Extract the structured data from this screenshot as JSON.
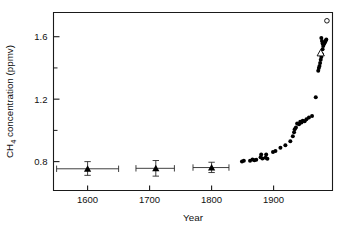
{
  "chart_data": {
    "type": "scatter",
    "title": "",
    "xlabel": "Year",
    "ylabel": "CH4 concentration (ppmv)",
    "ylabel_display": "CH",
    "ylabel_sub": "4",
    "ylabel_rest": " concentration (ppmv)",
    "xlim": [
      1545,
      1995
    ],
    "ylim": [
      0.615,
      1.755
    ],
    "grid": false,
    "legend": "none",
    "x_major_ticks": [
      1600,
      1700,
      1800,
      1900
    ],
    "x_tick_labels": [
      "1600",
      "1700",
      "1800",
      "1900"
    ],
    "y_major_ticks": [
      0.8,
      1.2,
      1.6
    ],
    "y_tick_labels": [
      "0.8",
      "1.2",
      "1.6"
    ],
    "y_minor_ticks": [
      1.0,
      1.4
    ],
    "colors": {
      "axis": "#1a1a1a",
      "marker_filled": "#000000",
      "marker_open_fill": "#ffffff",
      "marker_open_stroke": "#000000",
      "errorbar": "#2a2a2a",
      "background": "#ffffff"
    },
    "series": [
      {
        "name": "ice-core means with error bars",
        "marker": "triangle",
        "points": [
          {
            "x": 1600,
            "y": 0.754,
            "xerr_low": 50,
            "xerr_high": 50,
            "yerr_low": 0.042,
            "yerr_high": 0.046
          },
          {
            "x": 1710,
            "y": 0.757,
            "xerr_low": 32,
            "xerr_high": 30,
            "yerr_low": 0.05,
            "yerr_high": 0.05
          },
          {
            "x": 1800,
            "y": 0.762,
            "xerr_low": 30,
            "xerr_high": 28,
            "yerr_low": 0.032,
            "yerr_high": 0.034
          }
        ]
      },
      {
        "name": "ice-core individual samples",
        "marker": "filled-circle",
        "points": [
          {
            "x": 1849,
            "y": 0.8
          },
          {
            "x": 1852,
            "y": 0.805
          },
          {
            "x": 1862,
            "y": 0.806
          },
          {
            "x": 1866,
            "y": 0.814
          },
          {
            "x": 1869,
            "y": 0.808
          },
          {
            "x": 1872,
            "y": 0.812
          },
          {
            "x": 1879,
            "y": 0.828
          },
          {
            "x": 1880,
            "y": 0.846
          },
          {
            "x": 1882,
            "y": 0.82
          },
          {
            "x": 1887,
            "y": 0.824
          },
          {
            "x": 1888,
            "y": 0.845
          },
          {
            "x": 1890,
            "y": 0.818
          },
          {
            "x": 1899,
            "y": 0.862
          },
          {
            "x": 1903,
            "y": 0.868
          },
          {
            "x": 1911,
            "y": 0.888
          },
          {
            "x": 1919,
            "y": 0.905
          },
          {
            "x": 1927,
            "y": 0.93
          },
          {
            "x": 1931,
            "y": 0.962
          },
          {
            "x": 1933,
            "y": 0.988
          },
          {
            "x": 1934,
            "y": 1.008
          },
          {
            "x": 1936,
            "y": 1.018
          },
          {
            "x": 1938,
            "y": 1.044
          },
          {
            "x": 1941,
            "y": 1.04
          },
          {
            "x": 1943,
            "y": 1.056
          },
          {
            "x": 1945,
            "y": 1.05
          },
          {
            "x": 1947,
            "y": 1.062
          },
          {
            "x": 1950,
            "y": 1.058
          },
          {
            "x": 1953,
            "y": 1.072
          },
          {
            "x": 1957,
            "y": 1.082
          },
          {
            "x": 1962,
            "y": 1.092
          },
          {
            "x": 1968,
            "y": 1.212
          },
          {
            "x": 1972,
            "y": 1.382
          },
          {
            "x": 1973,
            "y": 1.4
          },
          {
            "x": 1974,
            "y": 1.412
          },
          {
            "x": 1975,
            "y": 1.432
          },
          {
            "x": 1976,
            "y": 1.452
          },
          {
            "x": 1977,
            "y": 1.47
          },
          {
            "x": 1978,
            "y": 1.488
          },
          {
            "x": 1979,
            "y": 1.52
          },
          {
            "x": 1980,
            "y": 1.54
          },
          {
            "x": 1981,
            "y": 1.552
          },
          {
            "x": 1982,
            "y": 1.56
          },
          {
            "x": 1983,
            "y": 1.566
          },
          {
            "x": 1984,
            "y": 1.574
          },
          {
            "x": 1985,
            "y": 1.582
          },
          {
            "x": 1979,
            "y": 1.556
          },
          {
            "x": 1978,
            "y": 1.572
          },
          {
            "x": 1977,
            "y": 1.592
          }
        ]
      },
      {
        "name": "modern atmospheric measurement",
        "marker": "open-circle",
        "points": [
          {
            "x": 1986,
            "y": 1.702
          }
        ]
      },
      {
        "name": "open triangle sample",
        "marker": "open-triangle",
        "points": [
          {
            "x": 1976,
            "y": 1.496
          }
        ]
      }
    ]
  },
  "figure": {
    "caption": ""
  }
}
